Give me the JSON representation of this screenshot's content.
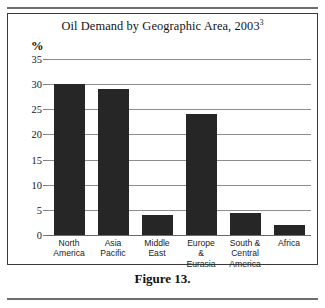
{
  "page": {
    "caption": "Figure 13."
  },
  "chart_data": {
    "type": "bar",
    "title": "Oil Demand by Geographic Area, 2003",
    "title_superscript": "3",
    "xlabel": "",
    "ylabel": "%",
    "ylim": [
      0,
      35
    ],
    "yticks": [
      0,
      5,
      10,
      15,
      20,
      25,
      30,
      35
    ],
    "ytick_labels": [
      "0",
      "5",
      "10",
      "15",
      "20",
      "25",
      "30",
      "35"
    ],
    "grid": true,
    "legend": false,
    "bar_color": "#262626",
    "categories": [
      "North America",
      "Asia Pacific",
      "Middle East",
      "Europe & Eurasia",
      "South & Central America",
      "Africa"
    ],
    "category_lines": [
      [
        "North",
        "America"
      ],
      [
        "Asia",
        "Pacific"
      ],
      [
        "Middle",
        "East"
      ],
      [
        "Europe",
        "&",
        "Eurasia"
      ],
      [
        "South &",
        "Central",
        "America"
      ],
      [
        "Africa"
      ]
    ],
    "values": [
      30,
      29,
      4,
      24,
      4.3,
      2
    ]
  }
}
